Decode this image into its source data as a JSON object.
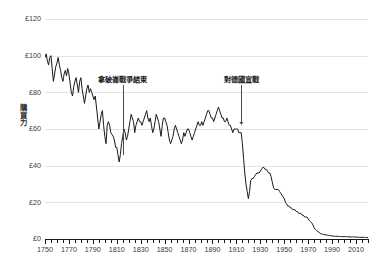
{
  "chart_data": {
    "type": "line",
    "title": "",
    "xlabel": "",
    "ylabel": "購買力",
    "xlim": [
      1750,
      2020
    ],
    "ylim": [
      0,
      120
    ],
    "grid": true,
    "legend": null,
    "currency_prefix": "£",
    "y_ticks": [
      120,
      100,
      80,
      60,
      40,
      20,
      0
    ],
    "y_tick_labels": [
      "£120",
      "£100",
      "£80",
      "£60",
      "£40",
      "£20",
      "£0"
    ],
    "x_ticks": [
      1750,
      1770,
      1790,
      1810,
      1830,
      1850,
      1870,
      1890,
      1910,
      1930,
      1950,
      1970,
      1990,
      2010
    ],
    "x_tick_labels": [
      "1750",
      "1770",
      "1790",
      "1810",
      "1830",
      "1850",
      "1870",
      "1890",
      "1910",
      "1930",
      "1950",
      "1970",
      "1990",
      "2010"
    ],
    "x_minor_tick_step": 5,
    "series": [
      {
        "name": "purchasing power",
        "color": "#1a1a1a",
        "x": [
          1750,
          1751,
          1752,
          1753,
          1754,
          1755,
          1756,
          1757,
          1758,
          1759,
          1760,
          1761,
          1762,
          1763,
          1764,
          1765,
          1766,
          1767,
          1768,
          1769,
          1770,
          1771,
          1772,
          1773,
          1774,
          1775,
          1776,
          1777,
          1778,
          1779,
          1780,
          1781,
          1782,
          1783,
          1784,
          1785,
          1786,
          1787,
          1788,
          1789,
          1790,
          1791,
          1792,
          1793,
          1794,
          1795,
          1796,
          1797,
          1798,
          1799,
          1800,
          1801,
          1802,
          1803,
          1804,
          1805,
          1806,
          1807,
          1808,
          1809,
          1810,
          1811,
          1812,
          1813,
          1814,
          1815,
          1816,
          1817,
          1818,
          1819,
          1820,
          1821,
          1822,
          1823,
          1824,
          1825,
          1826,
          1827,
          1828,
          1829,
          1830,
          1831,
          1832,
          1833,
          1834,
          1835,
          1836,
          1837,
          1838,
          1839,
          1840,
          1841,
          1842,
          1843,
          1844,
          1845,
          1846,
          1847,
          1848,
          1849,
          1850,
          1851,
          1852,
          1853,
          1854,
          1855,
          1856,
          1857,
          1858,
          1859,
          1860,
          1861,
          1862,
          1863,
          1864,
          1865,
          1866,
          1867,
          1868,
          1869,
          1870,
          1871,
          1872,
          1873,
          1874,
          1875,
          1876,
          1877,
          1878,
          1879,
          1880,
          1881,
          1882,
          1883,
          1884,
          1885,
          1886,
          1887,
          1888,
          1889,
          1890,
          1891,
          1892,
          1893,
          1894,
          1895,
          1896,
          1897,
          1898,
          1899,
          1900,
          1901,
          1902,
          1903,
          1904,
          1905,
          1906,
          1907,
          1908,
          1909,
          1910,
          1911,
          1912,
          1913,
          1914,
          1915,
          1916,
          1917,
          1918,
          1919,
          1920,
          1921,
          1922,
          1923,
          1924,
          1925,
          1926,
          1927,
          1928,
          1929,
          1930,
          1931,
          1932,
          1933,
          1934,
          1935,
          1936,
          1937,
          1938,
          1939,
          1940,
          1941,
          1942,
          1943,
          1944,
          1945,
          1946,
          1947,
          1948,
          1949,
          1950,
          1951,
          1952,
          1953,
          1954,
          1955,
          1956,
          1957,
          1958,
          1959,
          1960,
          1961,
          1962,
          1963,
          1964,
          1965,
          1966,
          1967,
          1968,
          1969,
          1970,
          1971,
          1972,
          1973,
          1974,
          1975,
          1976,
          1977,
          1978,
          1979,
          1980,
          1981,
          1982,
          1983,
          1984,
          1985,
          1986,
          1987,
          1988,
          1989,
          1990,
          1991,
          1992,
          1993,
          1994,
          1995,
          1996,
          1997,
          1998,
          1999,
          2000,
          2001,
          2002,
          2003,
          2004,
          2005,
          2006,
          2007,
          2008,
          2009,
          2010,
          2011,
          2012,
          2013,
          2014,
          2015,
          2016,
          2017,
          2018,
          2019,
          2020
        ],
        "y": [
          99,
          101,
          97,
          95,
          99,
          100,
          93,
          86,
          90,
          94,
          96,
          99,
          95,
          92,
          88,
          86,
          90,
          92,
          89,
          93,
          90,
          85,
          80,
          78,
          83,
          86,
          88,
          84,
          80,
          86,
          88,
          82,
          78,
          74,
          78,
          82,
          84,
          80,
          82,
          80,
          78,
          76,
          78,
          72,
          66,
          60,
          64,
          68,
          70,
          62,
          56,
          52,
          62,
          64,
          62,
          58,
          57,
          56,
          54,
          50,
          50,
          46,
          42,
          46,
          52,
          56,
          60,
          58,
          54,
          56,
          60,
          64,
          68,
          66,
          64,
          58,
          62,
          64,
          66,
          64,
          64,
          62,
          64,
          66,
          68,
          70,
          66,
          64,
          66,
          62,
          58,
          60,
          64,
          68,
          66,
          64,
          60,
          56,
          62,
          66,
          66,
          64,
          62,
          58,
          54,
          52,
          54,
          56,
          60,
          62,
          60,
          58,
          56,
          54,
          52,
          54,
          58,
          56,
          58,
          60,
          60,
          58,
          56,
          54,
          56,
          58,
          60,
          62,
          64,
          62,
          62,
          64,
          62,
          64,
          66,
          68,
          70,
          70,
          68,
          66,
          66,
          64,
          66,
          68,
          70,
          72,
          70,
          68,
          66,
          66,
          64,
          64,
          66,
          64,
          62,
          62,
          60,
          58,
          60,
          60,
          60,
          60,
          58,
          58,
          58,
          52,
          44,
          36,
          30,
          26,
          22,
          26,
          32,
          33,
          33,
          34,
          35,
          36,
          36,
          36,
          37,
          38,
          39,
          39,
          38,
          38,
          37,
          36,
          36,
          34,
          31,
          28,
          27,
          27,
          27,
          27,
          26,
          25,
          24,
          23,
          22,
          20,
          19,
          18,
          18,
          17,
          17,
          16,
          16,
          16,
          15,
          15,
          14,
          14,
          14,
          13,
          13,
          12,
          12,
          12,
          11,
          10,
          9.5,
          8.8,
          7.6,
          6.1,
          5.2,
          4.5,
          4.2,
          3.7,
          3.1,
          2.8,
          2.6,
          2.5,
          2.3,
          2.2,
          2.1,
          2.0,
          1.9,
          1.8,
          1.6,
          1.6,
          1.5,
          1.5,
          1.5,
          1.4,
          1.4,
          1.4,
          1.3,
          1.3,
          1.3,
          1.3,
          1.2,
          1.2,
          1.2,
          1.2,
          1.1,
          1.1,
          1.1,
          1.1,
          1.0,
          1.0,
          1.0,
          0.9,
          0.9,
          0.9,
          0.9,
          0.9,
          0.8,
          0.8,
          0.8
        ]
      }
    ],
    "annotations": [
      {
        "label": "拿破崙戰爭結束",
        "x_year": 1815,
        "text_y_value": 87,
        "line_top_value": 84,
        "line_bottom_value": 46,
        "arrow": false
      },
      {
        "label": "對德國宣戰",
        "x_year": 1914,
        "text_y_value": 87,
        "line_top_value": 84,
        "line_bottom_value": 62,
        "arrow": true
      }
    ]
  }
}
